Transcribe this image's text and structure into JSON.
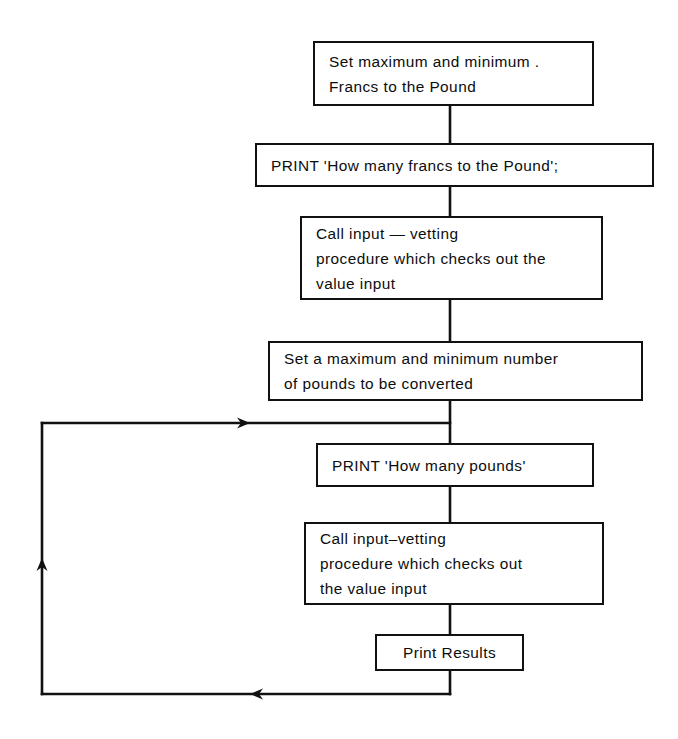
{
  "diagram": {
    "type": "flowchart",
    "line_color": "#111111",
    "background_color": "#ffffff",
    "nodes": [
      {
        "id": "set-francs-limits",
        "name": "set-maximum-minimum-francs-box",
        "lines": [
          "Set maximum and minimum .",
          "Francs to the Pound"
        ],
        "x": 313,
        "y": 41,
        "w": 281,
        "h": 65,
        "align": "left"
      },
      {
        "id": "print-prompt-francs",
        "name": "print-how-many-francs-box",
        "lines": [
          "PRINT 'How many francs to the Pound';"
        ],
        "x": 255,
        "y": 143,
        "w": 399,
        "h": 44,
        "align": "left"
      },
      {
        "id": "call-input-vetting-1",
        "name": "call-input-vetting-francs-box",
        "lines": [
          "Call input — vetting",
          "procedure which checks out the",
          "value input"
        ],
        "x": 300,
        "y": 216,
        "w": 303,
        "h": 84,
        "align": "left"
      },
      {
        "id": "set-pounds-limits",
        "name": "set-maximum-minimum-pounds-box",
        "lines": [
          "Set a maximum and minimum number",
          "of pounds to be converted"
        ],
        "x": 268,
        "y": 341,
        "w": 375,
        "h": 60,
        "align": "left"
      },
      {
        "id": "print-prompt-pounds",
        "name": "print-how-many-pounds-box",
        "lines": [
          "PRINT 'How many pounds'"
        ],
        "x": 316,
        "y": 443,
        "w": 278,
        "h": 44,
        "align": "left"
      },
      {
        "id": "call-input-vetting-2",
        "name": "call-input-vetting-pounds-box",
        "lines": [
          "Call input–vetting",
          "procedure which checks out",
          "the value input"
        ],
        "x": 304,
        "y": 522,
        "w": 300,
        "h": 83,
        "align": "left"
      },
      {
        "id": "print-results",
        "name": "print-results-box",
        "lines": [
          "Print Results"
        ],
        "x": 375,
        "y": 634,
        "w": 149,
        "h": 37,
        "align": "center"
      }
    ],
    "connectors": [
      {
        "name": "connector-box1-to-box2",
        "points": "450,106 450,143"
      },
      {
        "name": "connector-box2-to-box3",
        "points": "450,187 450,216"
      },
      {
        "name": "connector-box3-to-box4",
        "points": "450,300 450,341"
      },
      {
        "name": "connector-box4-to-box5",
        "points": "450,401 450,443"
      },
      {
        "name": "connector-box5-to-box6",
        "points": "450,487 450,522"
      },
      {
        "name": "connector-box6-to-results",
        "points": "450,605 450,634"
      },
      {
        "name": "connector-results-to-loop-bottom",
        "points": "450,671 450,694"
      },
      {
        "name": "loop-return-bottom-segment",
        "points": "450,694 42,694"
      },
      {
        "name": "loop-return-left-segment",
        "points": "42,694 42,423"
      },
      {
        "name": "loop-return-top-segment",
        "points": "42,423 450,423"
      }
    ],
    "arrowheads": [
      {
        "name": "loop-entry-arrowhead",
        "x": 250,
        "y": 423,
        "direction": "right"
      },
      {
        "name": "loop-left-up-arrowhead",
        "x": 42,
        "y": 558,
        "direction": "up"
      },
      {
        "name": "loop-bottom-left-arrowhead",
        "x": 250,
        "y": 694,
        "direction": "left"
      }
    ]
  }
}
